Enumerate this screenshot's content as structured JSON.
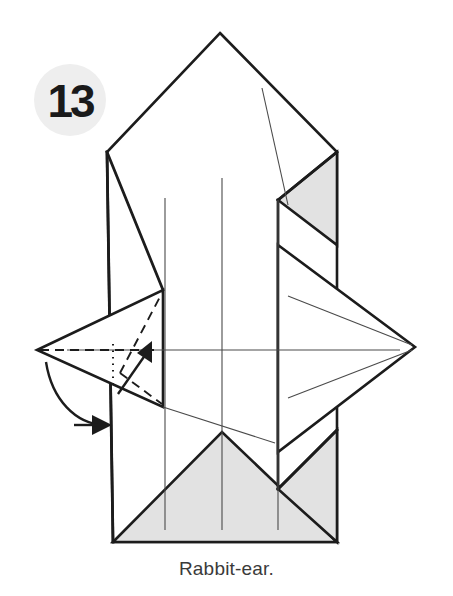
{
  "page": {
    "background_color": "#ffffff",
    "width": 453,
    "height": 596
  },
  "step": {
    "number": "13",
    "badge_fill": "#eeeeee",
    "badge_text_color": "#1a1a1a",
    "badge_center": [
      70,
      100
    ],
    "badge_radius": 36
  },
  "caption": {
    "text": "Rabbit-ear.",
    "color": "#3a3a3a"
  },
  "colors": {
    "paper_white": "#ffffff",
    "paper_shaded": "#e2e2e2",
    "edge_stroke": "#1c1c1c",
    "crease_stroke": "#4a4a4a"
  },
  "diagram": {
    "type": "origami-fold-instruction",
    "model_outline": {
      "apex": [
        220,
        33
      ],
      "left_shoulder": [
        107,
        152
      ],
      "right_shoulder": [
        337,
        152
      ],
      "bottom_left": [
        113,
        542
      ],
      "bottom_right": [
        337,
        542
      ]
    },
    "shaded_regions": [
      {
        "name": "upper-right-shaded-triangle",
        "points": "278,200 337,152 337,245"
      },
      {
        "name": "bottom-center-shaded-triangle",
        "points": "113,542 222,432 337,542"
      },
      {
        "name": "bottom-right-shaded-triangle",
        "points": "278,489 337,430 337,542"
      }
    ],
    "white_faces": [
      {
        "name": "left-rabbit-ear-flap",
        "points": "37,350 163,290 163,407"
      },
      {
        "name": "right-point-flap",
        "points": "278,245 415,347 278,452"
      }
    ],
    "vertical_creases": [
      {
        "name": "crease-left",
        "x": 165,
        "y1": 198,
        "y2": 530
      },
      {
        "name": "crease-center",
        "x": 222,
        "y1": 178,
        "y2": 530
      },
      {
        "name": "crease-right",
        "x": 278,
        "y1": 200,
        "y2": 530
      }
    ],
    "horizontal_crease": {
      "name": "crease-horizontal-midline",
      "x1": 67,
      "x2": 400,
      "y": 350
    },
    "diagonal_creases": [
      {
        "name": "crease-diagonal-upper-right",
        "x1": 262,
        "y1": 88,
        "x2": 288,
        "y2": 205
      },
      {
        "name": "crease-right-fan-upper",
        "x1": 288,
        "y1": 296,
        "x2": 412,
        "y2": 345
      },
      {
        "name": "crease-right-fan-lower",
        "x1": 288,
        "y1": 398,
        "x2": 412,
        "y2": 350
      },
      {
        "name": "crease-bottom-long",
        "x1": 163,
        "y1": 407,
        "x2": 275,
        "y2": 443
      }
    ],
    "fold_marks": [
      {
        "name": "valley-fold-horizontal-dashed",
        "style": "dashed",
        "from": [
          37,
          350
        ],
        "to": [
          163,
          350
        ]
      },
      {
        "name": "valley-fold-diagonal-upper-dashed",
        "style": "dashed",
        "from": [
          122,
          371
        ],
        "to": [
          163,
          292
        ]
      },
      {
        "name": "valley-fold-diagonal-lower-dashed",
        "style": "dashed",
        "from": [
          122,
          371
        ],
        "to": [
          163,
          405
        ]
      },
      {
        "name": "hidden-edge-dotted-vertical",
        "style": "dotted",
        "from": [
          113,
          345
        ],
        "to": [
          113,
          385
        ]
      }
    ],
    "arrows": [
      {
        "name": "fold-arrow-up-right",
        "kind": "straight",
        "from": [
          120,
          392
        ],
        "to": [
          150,
          348
        ],
        "description": "small straight arrow pointing up and right"
      },
      {
        "name": "fold-arrow-curved-down-left",
        "kind": "curved",
        "from": [
          48,
          361
        ],
        "to": [
          108,
          425
        ],
        "description": "curved arrow sweeping from the left point down to the lower right"
      }
    ]
  }
}
